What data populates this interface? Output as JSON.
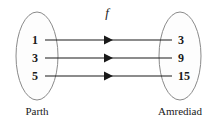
{
  "diagram": {
    "type": "mapping-diagram",
    "function_label": "f",
    "domain_set": {
      "name": "Parth",
      "label": "Parth",
      "elements": [
        "1",
        "3",
        "5"
      ]
    },
    "codomain_set": {
      "name": "Amrediad",
      "label": "Amrediad",
      "elements": [
        "3",
        "9",
        "15"
      ]
    },
    "mappings": [
      {
        "from": "1",
        "to": "3"
      },
      {
        "from": "3",
        "to": "9"
      },
      {
        "from": "5",
        "to": "15"
      }
    ],
    "colors": {
      "background": "#ffffff",
      "ellipse_fill": "#fdfdfd",
      "ellipse_stroke": "#8a8a8a",
      "line": "#1a1a1a",
      "text": "#1a1a1a"
    }
  }
}
